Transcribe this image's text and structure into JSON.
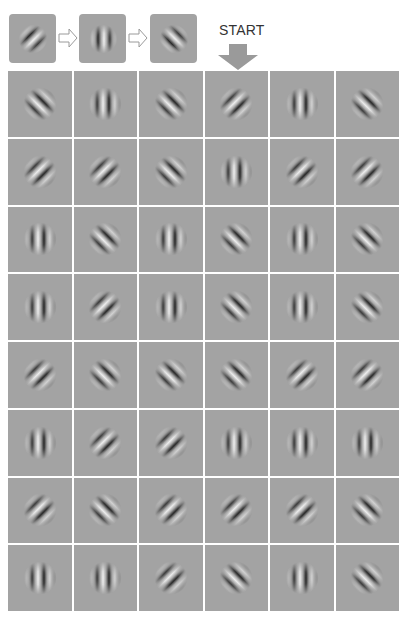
{
  "legend": {
    "sequence": [
      {
        "orientation": "right-diagonal",
        "symbol": "/"
      },
      {
        "orientation": "vertical",
        "symbol": "|"
      },
      {
        "orientation": "left-diagonal",
        "symbol": "\\"
      }
    ],
    "arrow_icon": "hollow-right-arrow",
    "start_label": "START",
    "start_icon": "down-arrow"
  },
  "colors": {
    "patch_background": "#a3a3a3",
    "grid_lines": "#ffffff",
    "arrow_fill": "#9a9a9a",
    "text": "#333333"
  },
  "grid": {
    "columns": 6,
    "rows": 8,
    "cells": [
      [
        "left-diagonal",
        "vertical",
        "left-diagonal",
        "right-diagonal",
        "vertical",
        "left-diagonal"
      ],
      [
        "right-diagonal",
        "right-diagonal",
        "left-diagonal",
        "vertical",
        "right-diagonal",
        "right-diagonal"
      ],
      [
        "vertical",
        "left-diagonal",
        "vertical",
        "left-diagonal",
        "vertical",
        "left-diagonal"
      ],
      [
        "vertical",
        "right-diagonal",
        "vertical",
        "left-diagonal",
        "vertical",
        "left-diagonal"
      ],
      [
        "right-diagonal",
        "left-diagonal",
        "left-diagonal",
        "left-diagonal",
        "right-diagonal",
        "right-diagonal"
      ],
      [
        "vertical",
        "right-diagonal",
        "right-diagonal",
        "vertical",
        "vertical",
        "vertical"
      ],
      [
        "right-diagonal",
        "left-diagonal",
        "right-diagonal",
        "right-diagonal",
        "right-diagonal",
        "left-diagonal"
      ],
      [
        "vertical",
        "vertical",
        "right-diagonal",
        "left-diagonal",
        "vertical",
        "left-diagonal"
      ]
    ]
  }
}
